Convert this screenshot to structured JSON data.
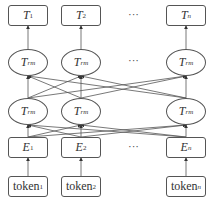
{
  "diagram": {
    "output_row": [
      {
        "main": "T",
        "sub": "1"
      },
      {
        "main": "T",
        "sub": "2"
      },
      {
        "main": "T",
        "sub": "n"
      }
    ],
    "transformer_rows": [
      [
        {
          "main": "T",
          "sub": "rm"
        },
        {
          "main": "T",
          "sub": "rm"
        },
        {
          "main": "T",
          "sub": "rm"
        }
      ],
      [
        {
          "main": "T",
          "sub": "rm"
        },
        {
          "main": "T",
          "sub": "rm"
        },
        {
          "main": "T",
          "sub": "rm"
        }
      ]
    ],
    "embedding_row": [
      {
        "main": "E",
        "sub": "1"
      },
      {
        "main": "E",
        "sub": "2"
      },
      {
        "main": "E",
        "sub": "n"
      }
    ],
    "token_row": [
      {
        "main": "token",
        "sub": "1"
      },
      {
        "main": "token",
        "sub": "2"
      },
      {
        "main": "token",
        "sub": "n"
      }
    ],
    "ellipsis": "···",
    "colors": {
      "stroke": "#555555",
      "text": "#333333",
      "background": "#ffffff"
    }
  }
}
